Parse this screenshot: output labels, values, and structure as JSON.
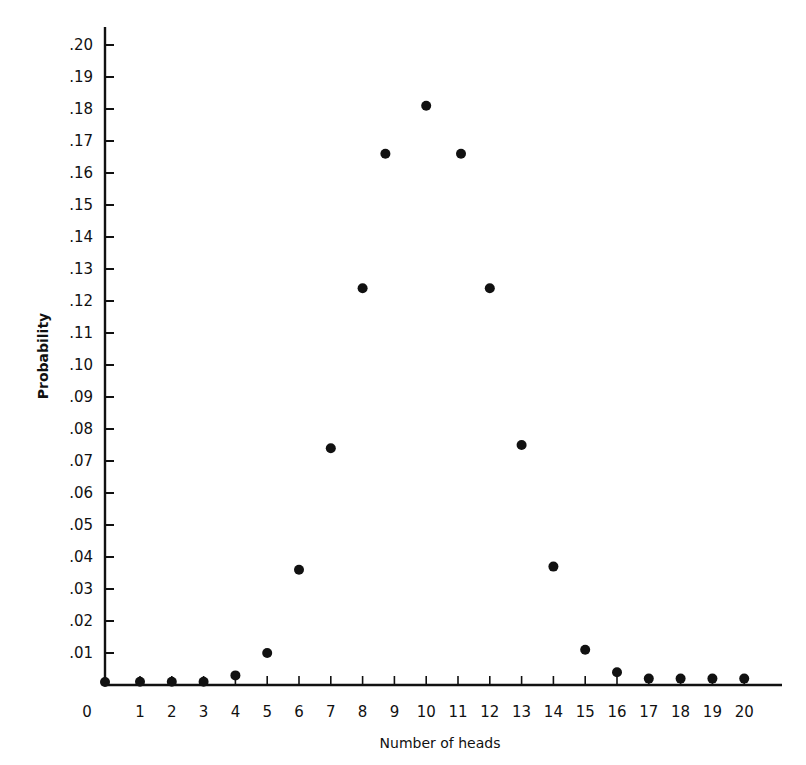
{
  "chart_data": {
    "type": "scatter",
    "title": "",
    "xlabel": "Number of heads",
    "ylabel": "Probability",
    "xlim": [
      0,
      21
    ],
    "ylim": [
      0,
      0.205
    ],
    "grid": false,
    "legend": null,
    "x_ticks": [
      "0",
      "1",
      "2",
      "3",
      "4",
      "5",
      "6",
      "7",
      "8",
      "9",
      "10",
      "11",
      "12",
      "13",
      "14",
      "15",
      "16",
      "17",
      "18",
      "19",
      "20"
    ],
    "y_ticks": [
      ".01",
      ".02",
      ".03",
      ".04",
      ".05",
      ".06",
      ".07",
      ".08",
      ".09",
      ".10",
      ".11",
      ".12",
      ".13",
      ".14",
      ".15",
      ".16",
      ".17",
      ".18",
      ".19",
      ".20"
    ],
    "x": [
      0,
      1,
      2,
      3,
      4,
      5,
      6,
      7,
      8,
      9,
      10,
      11,
      12,
      13,
      14,
      15,
      16,
      17,
      18,
      19,
      20
    ],
    "values": [
      0.0,
      0.001,
      0.001,
      0.001,
      0.003,
      0.01,
      0.036,
      0.074,
      0.124,
      0.166,
      0.181,
      0.166,
      0.124,
      0.075,
      0.037,
      0.011,
      0.004,
      0.002,
      0.002,
      0.002,
      0.002
    ]
  },
  "style": {
    "ink": "#111111",
    "background": "#ffffff"
  }
}
